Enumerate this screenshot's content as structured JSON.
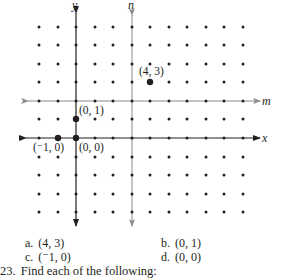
{
  "figure": {
    "grid": {
      "columns_x": [
        39,
        58,
        76,
        95,
        113,
        132,
        150,
        169,
        187,
        206,
        224,
        243
      ],
      "rows_y": [
        27,
        45,
        64,
        82,
        101,
        119,
        138,
        157,
        175,
        194,
        212
      ]
    },
    "axes": [
      {
        "name": "y",
        "orientation": "vertical",
        "label": "y",
        "color": "#231f20"
      },
      {
        "name": "n",
        "orientation": "vertical",
        "label": "n",
        "color": "#8a8a8a"
      },
      {
        "name": "m",
        "orientation": "horizontal",
        "label": "m",
        "color": "#8a8a8a"
      },
      {
        "name": "x",
        "orientation": "horizontal",
        "label": "x",
        "color": "#231f20"
      }
    ],
    "highlighted_points": [
      {
        "label": "(4, 3)",
        "x": 150,
        "y": 82
      },
      {
        "label": "(0, 1)",
        "x": 76,
        "y": 119
      },
      {
        "label": "(0, 0)",
        "x": 76,
        "y": 138
      },
      {
        "label": "(⁻1, 0)",
        "x": 58,
        "y": 138
      }
    ]
  },
  "choices": {
    "a": {
      "letter": "a.",
      "value": "(4, 3)"
    },
    "b": {
      "letter": "b.",
      "value": "(0, 1)"
    },
    "c": {
      "letter": "c.",
      "value": "(⁻1, 0)"
    },
    "d": {
      "letter": "d.",
      "value": "(0, 0)"
    }
  },
  "question": {
    "number": "23.",
    "text": "Find each of the following:"
  }
}
